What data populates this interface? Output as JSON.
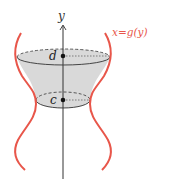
{
  "diagram": {
    "axis_label": "y",
    "curve_label": "x=g(y)",
    "upper_point_label": "d",
    "lower_point_label": "c",
    "colors": {
      "curve": "#e8564a",
      "label": "#e8564a",
      "axis": "#333333",
      "fill": "#d9d9d9",
      "ellipse": "#333333"
    }
  }
}
